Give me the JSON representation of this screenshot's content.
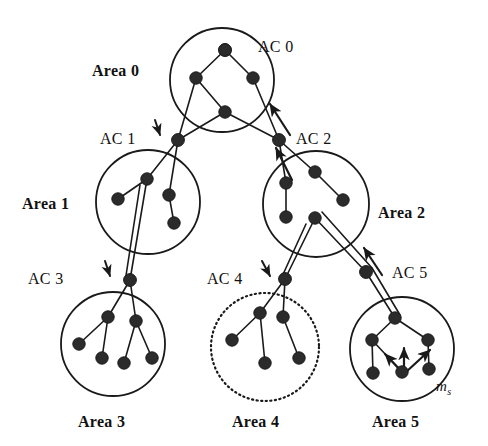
{
  "figure": {
    "width": 488,
    "height": 446,
    "background": "#ffffff",
    "ink_color": "#1a1a1a",
    "node_fill": "#2b2b2b"
  },
  "areas": [
    {
      "id": "area0",
      "label": "Area 0",
      "label_x": 92,
      "label_y": 63,
      "cx": 222,
      "cy": 80,
      "r": 52,
      "border": "solid",
      "nodes": [
        {
          "name": "a0-n1",
          "x": 225,
          "y": 50
        },
        {
          "name": "a0-n2",
          "x": 196,
          "y": 78
        },
        {
          "name": "a0-n3",
          "x": 253,
          "y": 78
        },
        {
          "name": "a0-n4",
          "x": 225,
          "y": 112
        }
      ],
      "links": [
        [
          0,
          1
        ],
        [
          0,
          2
        ],
        [
          1,
          3
        ]
      ]
    },
    {
      "id": "area1",
      "label": "Area 1",
      "label_x": 22,
      "label_y": 196,
      "cx": 148,
      "cy": 202,
      "r": 52,
      "border": "solid",
      "nodes": [
        {
          "name": "a1-n1",
          "x": 147,
          "y": 179
        },
        {
          "name": "a1-n2",
          "x": 118,
          "y": 199
        },
        {
          "name": "a1-n3",
          "x": 169,
          "y": 195
        },
        {
          "name": "a1-n4",
          "x": 174,
          "y": 223
        }
      ],
      "links": [
        [
          0,
          1
        ],
        [
          2,
          3
        ]
      ]
    },
    {
      "id": "area2",
      "label": "Area 2",
      "label_x": 378,
      "label_y": 205,
      "cx": 316,
      "cy": 204,
      "r": 53,
      "border": "solid",
      "nodes": [
        {
          "name": "a2-n1",
          "x": 315,
          "y": 172
        },
        {
          "name": "a2-n2",
          "x": 286,
          "y": 183
        },
        {
          "name": "a2-n3",
          "x": 343,
          "y": 200
        },
        {
          "name": "a2-n4",
          "x": 286,
          "y": 217
        },
        {
          "name": "a2-n5",
          "x": 315,
          "y": 218
        }
      ],
      "links": [
        [
          0,
          2
        ],
        [
          1,
          3
        ]
      ]
    },
    {
      "id": "area3",
      "label": "Area 3",
      "label_x": 78,
      "label_y": 414,
      "cx": 113,
      "cy": 344,
      "r": 52,
      "border": "solid",
      "nodes": [
        {
          "name": "a3-n1",
          "x": 108,
          "y": 317
        },
        {
          "name": "a3-n2",
          "x": 136,
          "y": 321
        },
        {
          "name": "a3-n3",
          "x": 79,
          "y": 344
        },
        {
          "name": "a3-n4",
          "x": 102,
          "y": 358
        },
        {
          "name": "a3-n5",
          "x": 124,
          "y": 363
        },
        {
          "name": "a3-n6",
          "x": 152,
          "y": 358
        }
      ],
      "links": [
        [
          0,
          2
        ],
        [
          0,
          3
        ],
        [
          1,
          4
        ],
        [
          1,
          5
        ]
      ]
    },
    {
      "id": "area4",
      "label": "Area 4",
      "label_x": 232,
      "label_y": 414,
      "cx": 265,
      "cy": 347,
      "r": 54,
      "border": "dotted",
      "nodes": [
        {
          "name": "a4-n1",
          "x": 260,
          "y": 313
        },
        {
          "name": "a4-n2",
          "x": 283,
          "y": 317
        },
        {
          "name": "a4-n3",
          "x": 232,
          "y": 340
        },
        {
          "name": "a4-n4",
          "x": 265,
          "y": 363
        },
        {
          "name": "a4-n5",
          "x": 299,
          "y": 358
        }
      ],
      "links": [
        [
          0,
          2
        ],
        [
          0,
          3
        ],
        [
          1,
          4
        ]
      ]
    },
    {
      "id": "area5",
      "label": "Area 5",
      "label_x": 372,
      "label_y": 414,
      "cx": 402,
      "cy": 349,
      "r": 52,
      "border": "solid",
      "nodes": [
        {
          "name": "a5-n1",
          "x": 395,
          "y": 318
        },
        {
          "name": "a5-n2",
          "x": 372,
          "y": 340
        },
        {
          "name": "a5-n3",
          "x": 428,
          "y": 340
        },
        {
          "name": "a5-n4",
          "x": 373,
          "y": 373
        },
        {
          "name": "a5-n5",
          "x": 402,
          "y": 372
        },
        {
          "name": "a5-n6",
          "x": 429,
          "y": 369
        }
      ],
      "links": [
        [
          0,
          1
        ],
        [
          0,
          2
        ],
        [
          1,
          3
        ],
        [
          1,
          4
        ],
        [
          2,
          5
        ]
      ]
    }
  ],
  "connectors": [
    {
      "id": "ac0",
      "label": "AC 0",
      "x": 225,
      "y": 50,
      "label_x": 258,
      "label_y": 39,
      "has_arrow": false
    },
    {
      "id": "ac1",
      "label": "AC 1",
      "x": 178,
      "y": 140,
      "label_x": 100,
      "label_y": 131,
      "has_arrow": true,
      "arrow_x1": 155,
      "arrow_y1": 120,
      "arrow_x2": 160,
      "arrow_y2": 135
    },
    {
      "id": "ac2",
      "label": "AC 2",
      "x": 279,
      "y": 140,
      "label_x": 296,
      "label_y": 131,
      "has_arrow": false
    },
    {
      "id": "ac3",
      "label": "AC 3",
      "x": 130,
      "y": 280,
      "label_x": 28,
      "label_y": 271,
      "has_arrow": true,
      "arrow_x1": 105,
      "arrow_y1": 261,
      "arrow_x2": 110,
      "arrow_y2": 276
    },
    {
      "id": "ac4",
      "label": "AC 4",
      "x": 285,
      "y": 279,
      "label_x": 207,
      "label_y": 271,
      "has_arrow": true,
      "arrow_x1": 262,
      "arrow_y1": 261,
      "arrow_x2": 270,
      "arrow_y2": 276
    },
    {
      "id": "ac5",
      "label": "AC 5",
      "x": 366,
      "y": 272,
      "label_x": 392,
      "label_y": 265,
      "has_arrow": false
    }
  ],
  "interarea_links": [
    {
      "name": "area0-to-ac1-a",
      "x1": 196,
      "y1": 78,
      "x2": 178,
      "y2": 140
    },
    {
      "name": "area0-to-ac1-b",
      "x1": 225,
      "y1": 112,
      "x2": 178,
      "y2": 140
    },
    {
      "name": "ac1-to-area1-a",
      "x1": 178,
      "y1": 140,
      "x2": 147,
      "y2": 179
    },
    {
      "name": "ac1-to-area1-b",
      "x1": 178,
      "y1": 140,
      "x2": 169,
      "y2": 195
    },
    {
      "name": "area0-to-ac2-a",
      "x1": 253,
      "y1": 78,
      "x2": 279,
      "y2": 140
    },
    {
      "name": "area0-to-ac2-b",
      "x1": 225,
      "y1": 112,
      "x2": 279,
      "y2": 140
    },
    {
      "name": "ac2-to-area2-a",
      "x1": 279,
      "y1": 140,
      "x2": 315,
      "y2": 172
    },
    {
      "name": "ac2-to-area2-b",
      "x1": 279,
      "y1": 140,
      "x2": 286,
      "y2": 183
    },
    {
      "name": "area1-to-ac3-a",
      "x1": 147,
      "y1": 179,
      "x2": 130,
      "y2": 280
    },
    {
      "name": "area1-to-ac3-b",
      "x1": 140,
      "y1": 185,
      "x2": 125,
      "y2": 282
    },
    {
      "name": "ac3-to-area3-a",
      "x1": 130,
      "y1": 280,
      "x2": 108,
      "y2": 317
    },
    {
      "name": "ac3-to-area3-b",
      "x1": 130,
      "y1": 280,
      "x2": 136,
      "y2": 321
    },
    {
      "name": "area2-to-ac4-a",
      "x1": 315,
      "y1": 218,
      "x2": 285,
      "y2": 279
    },
    {
      "name": "area2-to-ac4-b",
      "x1": 306,
      "y1": 224,
      "x2": 280,
      "y2": 281
    },
    {
      "name": "ac4-to-area4-a",
      "x1": 285,
      "y1": 279,
      "x2": 260,
      "y2": 313
    },
    {
      "name": "ac4-to-area4-b",
      "x1": 285,
      "y1": 279,
      "x2": 283,
      "y2": 317
    },
    {
      "name": "area2-to-ac5-a",
      "x1": 315,
      "y1": 218,
      "x2": 366,
      "y2": 272
    },
    {
      "name": "area2-to-ac5-b",
      "x1": 322,
      "y1": 212,
      "x2": 372,
      "y2": 268
    },
    {
      "name": "ac5-to-area5-a",
      "x1": 366,
      "y1": 272,
      "x2": 395,
      "y2": 318
    },
    {
      "name": "ac5-to-area5-b",
      "x1": 372,
      "y1": 268,
      "x2": 400,
      "y2": 315
    }
  ],
  "flow_arrows": [
    {
      "name": "arrow-to-ac0",
      "x1": 290,
      "y1": 135,
      "x2": 270,
      "y2": 104
    },
    {
      "name": "arrow-to-ac2-from-area2",
      "x1": 292,
      "y1": 180,
      "x2": 276,
      "y2": 148
    },
    {
      "name": "arrow-to-ac5-from-area2",
      "x1": 382,
      "y1": 275,
      "x2": 364,
      "y2": 248
    }
  ],
  "ms_marker": {
    "label": "m",
    "subscript": "s",
    "label_x": 436,
    "label_y": 379,
    "source_node": "a5-n5",
    "arrows": [
      {
        "name": "ms-arrow-up-left",
        "x1": 404,
        "y1": 374,
        "x2": 385,
        "y2": 354
      },
      {
        "name": "ms-arrow-up",
        "x1": 404,
        "y1": 372,
        "x2": 404,
        "y2": 348
      },
      {
        "name": "ms-arrow-up-right",
        "x1": 406,
        "y1": 372,
        "x2": 430,
        "y2": 350
      }
    ]
  }
}
